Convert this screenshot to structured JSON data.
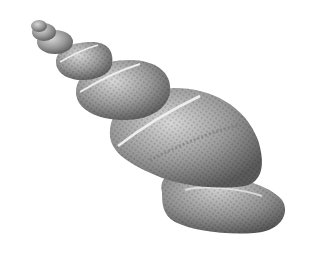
{
  "image": {
    "subject": "3D rendered spiral seashell",
    "background_color": "#ffffff",
    "shell_color": "#9a9a9a",
    "highlight_color": "#e6e6e6",
    "shadow_color": "#555555",
    "whorl_count": 6
  }
}
